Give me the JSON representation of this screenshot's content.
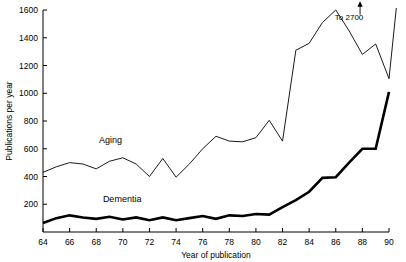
{
  "chart_data": {
    "type": "line",
    "title": "",
    "xlabel": "Year of publication",
    "ylabel": "Publications per year",
    "xlim": [
      64,
      90
    ],
    "ylim": [
      0,
      1600
    ],
    "grid": false,
    "legend": "inline-labels",
    "x_ticks": [
      "64",
      "66",
      "68",
      "70",
      "72",
      "74",
      "76",
      "78",
      "80",
      "82",
      "84",
      "86",
      "88",
      "90"
    ],
    "x_tick_values": [
      64,
      66,
      68,
      70,
      72,
      74,
      76,
      78,
      80,
      82,
      84,
      86,
      88,
      90
    ],
    "y_ticks": [
      "200",
      "400",
      "600",
      "800",
      "1000",
      "1200",
      "1400",
      "1600"
    ],
    "y_tick_values": [
      200,
      400,
      600,
      800,
      1000,
      1200,
      1400,
      1600
    ],
    "x": [
      64,
      65,
      66,
      67,
      68,
      69,
      70,
      71,
      72,
      73,
      74,
      75,
      76,
      77,
      78,
      79,
      80,
      81,
      82,
      83,
      84,
      85,
      86,
      87,
      88,
      89,
      90
    ],
    "series": [
      {
        "name": "Aging",
        "label": "Aging",
        "color": "#000000",
        "line_width": 0.9,
        "values": [
          430,
          470,
          500,
          490,
          455,
          510,
          535,
          490,
          400,
          530,
          395,
          490,
          600,
          690,
          655,
          650,
          680,
          805,
          655,
          1310,
          1360,
          1510,
          1600,
          1450,
          1280,
          1355,
          1105
        ],
        "note": "Final segment rises off the top of the plot toward 2700 at 1990"
      },
      {
        "name": "Dementia",
        "label": "Dementia",
        "color": "#000000",
        "line_width": 2.6,
        "values": [
          65,
          100,
          120,
          105,
          95,
          110,
          90,
          105,
          85,
          105,
          85,
          100,
          115,
          95,
          120,
          115,
          130,
          125,
          180,
          230,
          290,
          390,
          395,
          500,
          600,
          600,
          1010
        ]
      }
    ],
    "annotations": [
      {
        "name": "off-scale-note",
        "text": "To 2700",
        "x": 87,
        "y": 1530,
        "arrow": "up"
      }
    ],
    "series_labels": [
      {
        "name": "aging-label",
        "text": "Aging",
        "x": 68.2,
        "y": 640
      },
      {
        "name": "dementia-label",
        "text": "Dementia",
        "x": 68.5,
        "y": 215
      }
    ]
  }
}
